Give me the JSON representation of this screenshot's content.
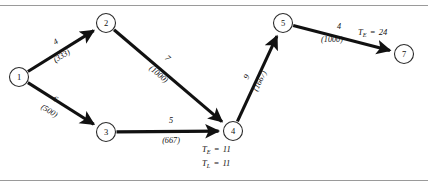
{
  "figure": {
    "kind": "project-network-diagram",
    "rules": {
      "top_label": "horizontal-rule",
      "bottom_label": "horizontal-rule"
    }
  },
  "nodes": [
    {
      "id": "1",
      "label": "1",
      "cx": 19,
      "cy": 77,
      "r": 9.5
    },
    {
      "id": "2",
      "label": "2",
      "cx": 106,
      "cy": 23,
      "r": 9.5
    },
    {
      "id": "3",
      "label": "3",
      "cx": 106,
      "cy": 132,
      "r": 9.5
    },
    {
      "id": "4",
      "label": "4",
      "cx": 233,
      "cy": 131,
      "r": 9.5
    },
    {
      "id": "5",
      "label": "5",
      "cx": 283,
      "cy": 23,
      "r": 9.5
    },
    {
      "id": "7",
      "label": "7",
      "cx": 404,
      "cy": 54,
      "r": 9.5
    }
  ],
  "edges": [
    {
      "id": "e1-2",
      "from": "1",
      "to": "2",
      "duration": "4",
      "cost": "(333)",
      "dur_x": 57,
      "dur_y": 44,
      "cost_x": 63,
      "cost_y": 58,
      "rotate": -32
    },
    {
      "id": "e1-3",
      "from": "1",
      "to": "3",
      "duration": "6",
      "cost": "(500)",
      "dur_x": 54,
      "dur_y": 101,
      "cost_x": 48,
      "cost_y": 113,
      "rotate": 32
    },
    {
      "id": "e2-4",
      "from": "2",
      "to": "4",
      "duration": "7",
      "cost": "(1000)",
      "dur_x": 166,
      "dur_y": 60,
      "cost_x": 157,
      "cost_y": 76,
      "rotate": 40
    },
    {
      "id": "e3-4",
      "from": "3",
      "to": "4",
      "duration": "5",
      "cost": "(667)",
      "dur_x": 171,
      "dur_y": 123,
      "cost_x": 171,
      "cost_y": 143,
      "rotate": 0
    },
    {
      "id": "e4-5",
      "from": "4",
      "to": "5",
      "duration": "9",
      "cost": "(1667)",
      "dur_x": 249,
      "dur_y": 78,
      "cost_x": 262,
      "cost_y": 82,
      "rotate": -64
    },
    {
      "id": "e5-7",
      "from": "5",
      "to": "7",
      "duration": "4",
      "cost": "(1000)",
      "dur_x": 339,
      "dur_y": 29,
      "cost_x": 332,
      "cost_y": 42,
      "rotate": 0
    }
  ],
  "time_labels": [
    {
      "id": "node4-te",
      "symbol": "T",
      "sub": "E",
      "equals": "=",
      "value": "11",
      "x": 202,
      "y": 152
    },
    {
      "id": "node4-tl",
      "symbol": "T",
      "sub": "L",
      "equals": "=",
      "value": "11",
      "x": 202,
      "y": 166
    },
    {
      "id": "node7-te",
      "symbol": "T",
      "sub": "E",
      "equals": "=",
      "value": "24",
      "x": 358,
      "y": 35
    }
  ],
  "colors": {
    "line": "#111111",
    "node_stroke": "#2b2b2b",
    "rule": "#9a9a9a",
    "background": "#ffffff"
  }
}
